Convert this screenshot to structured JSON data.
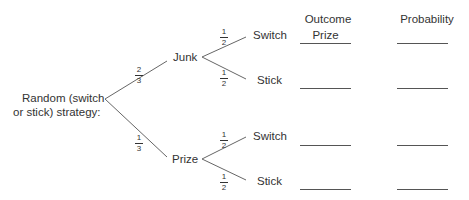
{
  "headers": {
    "outcome": "Outcome",
    "probability": "Probability"
  },
  "root": {
    "label_line1": "Random (switch",
    "label_line2": "or stick) strategy:"
  },
  "branches": [
    {
      "label": "Junk",
      "probability": {
        "num": "2",
        "den": "3"
      },
      "children": [
        {
          "label": "Switch",
          "probability": {
            "num": "1",
            "den": "2"
          },
          "outcome": "Prize",
          "outcome_probability": ""
        },
        {
          "label": "Stick",
          "probability": {
            "num": "1",
            "den": "2"
          },
          "outcome": "",
          "outcome_probability": ""
        }
      ]
    },
    {
      "label": "Prize",
      "probability": {
        "num": "1",
        "den": "3"
      },
      "children": [
        {
          "label": "Switch",
          "probability": {
            "num": "1",
            "den": "2"
          },
          "outcome": "",
          "outcome_probability": ""
        },
        {
          "label": "Stick",
          "probability": {
            "num": "1",
            "den": "2"
          },
          "outcome": "",
          "outcome_probability": ""
        }
      ]
    }
  ],
  "colors": {
    "line": "#555555",
    "text": "#333333"
  }
}
